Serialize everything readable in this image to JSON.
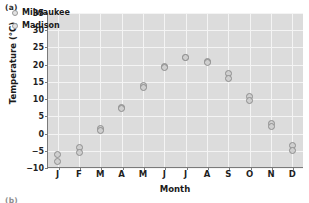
{
  "figure": {
    "panel_label": "(a)",
    "next_panel_label": "(b)"
  },
  "legend": {
    "position": "top-left-inside",
    "entries": [
      {
        "label": "Milwaukee",
        "marker": "open-circle"
      },
      {
        "label": "Madison",
        "marker": "open-circle"
      }
    ]
  },
  "colors": {
    "plot_background": "#dcdcdc",
    "gridline": "#f4f4f4",
    "axis": "#7a7a7a",
    "marker_stroke": "#8e8e8e",
    "marker_fill": "#cfcfcf",
    "text": "#1a1a1a"
  },
  "chart_data": {
    "type": "scatter",
    "title": "",
    "xlabel": "Month",
    "ylabel": "Temperature (°C)",
    "categories": [
      "J",
      "F",
      "M",
      "A",
      "M",
      "J",
      "J",
      "A",
      "S",
      "O",
      "N",
      "D"
    ],
    "category_names": [
      "January",
      "February",
      "March",
      "April",
      "May",
      "June",
      "July",
      "August",
      "September",
      "October",
      "November",
      "December"
    ],
    "ylim": [
      -10,
      35
    ],
    "yticks": [
      -10,
      -5,
      0,
      5,
      10,
      15,
      20,
      25,
      30,
      35
    ],
    "ytick_labels": [
      "-10",
      "-5",
      "0",
      "5",
      "10",
      "15",
      "20",
      "25",
      "30",
      "35"
    ],
    "grid": true,
    "legend_position": "upper left",
    "series": [
      {
        "name": "Milwaukee",
        "marker": "open-circle",
        "values": [
          -6.0,
          -4.0,
          1.5,
          7.5,
          14.0,
          19.5,
          22.0,
          21.0,
          17.5,
          10.8,
          3.0,
          -3.5
        ]
      },
      {
        "name": "Madison",
        "marker": "open-circle",
        "values": [
          -8.0,
          -5.5,
          0.8,
          7.3,
          13.5,
          19.3,
          22.0,
          20.5,
          16.0,
          9.5,
          2.0,
          -5.0
        ]
      }
    ]
  }
}
